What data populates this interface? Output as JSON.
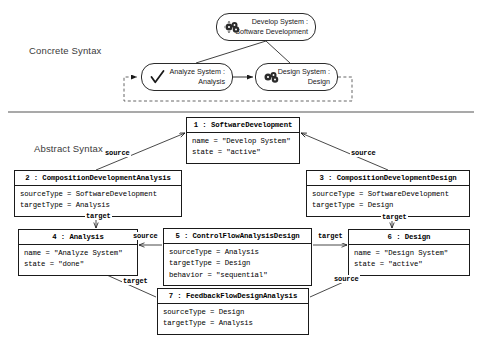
{
  "sections": {
    "concrete": {
      "caption": "Concrete Syntax"
    },
    "abstract": {
      "caption": "Abstract Syntax"
    }
  },
  "concrete_syntax": {
    "nodes": [
      {
        "id": "develop",
        "icon": "gears-icon",
        "line1": "Develop System :",
        "line2": "Software Development"
      },
      {
        "id": "analyze",
        "icon": "checkmark-icon",
        "line1": "Analyze System :",
        "line2": "Analysis"
      },
      {
        "id": "design",
        "icon": "gears-icon",
        "line1": "Design System :",
        "line2": "Design"
      }
    ]
  },
  "abstract_syntax": {
    "objects": [
      {
        "id": "box-1",
        "header": "1 : SoftwareDevelopment",
        "attributes": [
          "name = \"Develop System\"",
          "state = \"active\""
        ]
      },
      {
        "id": "box-2",
        "header": "2 : CompositionDevelopmentAnalysis",
        "attributes": [
          "sourceType = SoftwareDevelopment",
          "targetType = Analysis"
        ]
      },
      {
        "id": "box-3",
        "header": "3 : CompositionDevelopmentDesign",
        "attributes": [
          "sourceType = SoftwareDevelopment",
          "targetType = Design"
        ]
      },
      {
        "id": "box-4",
        "header": "4 : Analysis",
        "attributes": [
          "name = \"Analyze System\"",
          "state = \"done\""
        ]
      },
      {
        "id": "box-5",
        "header": "5 : ControlFlowAnalysisDesign",
        "attributes": [
          "sourceType = Analysis",
          "targetType = Design",
          "behavior = \"sequential\""
        ]
      },
      {
        "id": "box-6",
        "header": "6 : Design",
        "attributes": [
          "name = \"Design System\"",
          "state = \"active\""
        ]
      },
      {
        "id": "box-7",
        "header": "7 : FeedbackFlowDesignAnalysis",
        "attributes": [
          "sourceType = Design",
          "targetType = Analysis"
        ]
      }
    ],
    "edge_labels": [
      {
        "id": "lbl-src-1",
        "text": "source"
      },
      {
        "id": "lbl-src-2",
        "text": "source"
      },
      {
        "id": "lbl-tgt-1",
        "text": "target"
      },
      {
        "id": "lbl-tgt-2",
        "text": "target"
      },
      {
        "id": "lbl-src-3",
        "text": "source"
      },
      {
        "id": "lbl-tgt-3",
        "text": "target"
      },
      {
        "id": "lbl-tgt-4",
        "text": "target"
      },
      {
        "id": "lbl-src-4",
        "text": "source"
      }
    ]
  },
  "colors": {
    "stroke": "#1a1a1a",
    "divider": "#555555",
    "caption": "#3a3a3a",
    "background": "#ffffff"
  }
}
